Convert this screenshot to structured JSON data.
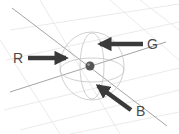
{
  "diagram": {
    "type": "3d-gizmo-illustration",
    "background": "#ffffff",
    "grid_color": "#e2e2e2",
    "axis_color": "#9a9a9a",
    "arrow_color": "#3a3a3a",
    "sphere_color": "#555555",
    "arrows": [
      {
        "label": "R",
        "direction": "right",
        "color": "#3a3a3a"
      },
      {
        "label": "G",
        "direction": "left",
        "color": "#3a3a3a"
      },
      {
        "label": "B",
        "direction": "up-left",
        "color": "#3a3a3a"
      }
    ],
    "center_object": "light-sphere"
  }
}
